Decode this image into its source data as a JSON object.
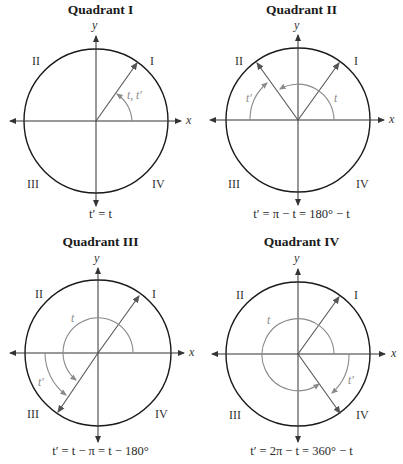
{
  "figure": {
    "panels": [
      {
        "title": "Quadrant I",
        "formula": "t′ = t",
        "quadrant_labels": [
          "I",
          "II",
          "III",
          "IV"
        ],
        "axis_labels": {
          "x": "x",
          "y": "y"
        },
        "angle_labels": [
          "t, t′"
        ],
        "terminal_angle_deg": 53
      },
      {
        "title": "Quadrant II",
        "formula": "t′ = π − t = 180° − t",
        "quadrant_labels": [
          "I",
          "II",
          "III",
          "IV"
        ],
        "axis_labels": {
          "x": "x",
          "y": "y"
        },
        "angle_labels": [
          "t",
          "t′"
        ],
        "terminal_angle_deg": 127
      },
      {
        "title": "Quadrant III",
        "formula": "t′ = t − π = t − 180°",
        "quadrant_labels": [
          "I",
          "II",
          "III",
          "IV"
        ],
        "axis_labels": {
          "x": "x",
          "y": "y"
        },
        "angle_labels": [
          "t",
          "t′"
        ],
        "terminal_angle_deg": 233
      },
      {
        "title": "Quadrant IV",
        "formula": "t′ = 2π − t = 360° − t",
        "quadrant_labels": [
          "I",
          "II",
          "III",
          "IV"
        ],
        "axis_labels": {
          "x": "x",
          "y": "y"
        },
        "angle_labels": [
          "t",
          "t′"
        ],
        "terminal_angle_deg": 307
      }
    ],
    "colors": {
      "circle": "#1a1a1a",
      "axes": "#333333",
      "ray": "#555555",
      "arc": "#8a8a8a"
    }
  }
}
